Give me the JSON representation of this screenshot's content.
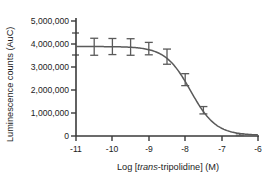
{
  "chart_data": {
    "type": "line",
    "title": "",
    "xlabel_parts": {
      "pre": "Log [",
      "italic": "trans",
      "post": "-tripolidine] (M)"
    },
    "xlabel": "Log [trans-tripolidine] (M)",
    "ylabel": "Luminescence counts (AuC)",
    "xlim": [
      -11,
      -6
    ],
    "ylim": [
      0,
      5000000
    ],
    "xticks": [
      -11,
      -10,
      -9,
      -8,
      -7,
      -6
    ],
    "xtick_labels": [
      "-11",
      "-10",
      "-9",
      "-8",
      "-7",
      "-6"
    ],
    "yticks": [
      0,
      1000000,
      2000000,
      3000000,
      4000000,
      5000000
    ],
    "ytick_labels": [
      "0",
      "1,000,000",
      "2,000,000",
      "3,000,000",
      "4,000,000",
      "5,000,000"
    ],
    "grid": false,
    "legend": false,
    "series": [
      {
        "name": "trans-tripolidine dose response",
        "marker": "error-bar",
        "color": "#5a5a5a",
        "x": [
          -10.5,
          -10.0,
          -9.5,
          -9.0,
          -8.5,
          -8.0,
          -7.5,
          -6.5
        ],
        "y": [
          3880000,
          3890000,
          3870000,
          3800000,
          3450000,
          2450000,
          1120000,
          60000
        ],
        "yerr": [
          370000,
          350000,
          360000,
          270000,
          330000,
          260000,
          160000,
          40000
        ]
      }
    ],
    "fit_curve": {
      "name": "sigmoidal fit",
      "color": "#5a5a5a",
      "top": 3890000,
      "bottom": 30000,
      "logIC50": -7.85,
      "hillslope": 1.25
    },
    "colors": {
      "axis": "#3a3a3a",
      "data": "#5a5a5a",
      "text": "#1c1c1c",
      "background": "#ffffff"
    }
  }
}
